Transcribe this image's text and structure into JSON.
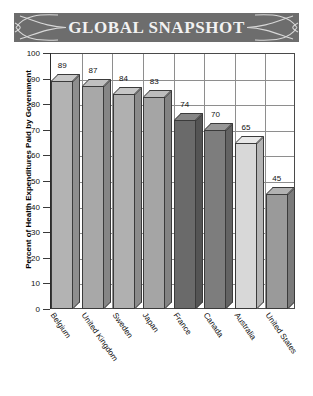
{
  "banner": {
    "title": "GLOBAL SNAPSHOT",
    "background_color": "#6d6d6d",
    "text_color": "#f2f2f2",
    "ornament_left": "swirl-ribbon-ornament",
    "ornament_right": "swirl-ribbon-ornament"
  },
  "chart_data": {
    "type": "bar",
    "title": "GLOBAL SNAPSHOT",
    "xlabel": "",
    "ylabel": "Percent of Health Expenditures Paid by Government",
    "ylim": [
      0,
      100
    ],
    "yticks": [
      0,
      10,
      20,
      30,
      40,
      50,
      60,
      70,
      80,
      90,
      100
    ],
    "grid": true,
    "legend": "none",
    "style_3d": true,
    "categories": [
      "Belgium",
      "United Kingdom",
      "Sweden",
      "Japan",
      "France",
      "Canada",
      "Australia",
      "United States"
    ],
    "values": [
      89,
      87,
      84,
      83,
      74,
      70,
      65,
      45
    ],
    "bar_colors": [
      "#b3b3b3",
      "#a8a8a8",
      "#b0b0b0",
      "#a5a5a5",
      "#6a6a6a",
      "#7d7d7d",
      "#d8d8d8",
      "#9a9a9a"
    ],
    "bar_top_colors": [
      "#c9c9c9",
      "#c0c0c0",
      "#c6c6c6",
      "#bcbcbc",
      "#868686",
      "#979797",
      "#e8e8e8",
      "#b2b2b2"
    ],
    "bar_side_colors": [
      "#8e8e8e",
      "#868686",
      "#8b8b8b",
      "#838383",
      "#545454",
      "#636363",
      "#b4b4b4",
      "#7a7a7a"
    ],
    "data_labels": [
      "89",
      "87",
      "84",
      "83",
      "74",
      "70",
      "65",
      "45"
    ]
  },
  "axis": {
    "tick_labels": [
      "100",
      "90",
      "80",
      "70",
      "60",
      "50",
      "40",
      "30",
      "20",
      "10",
      "0"
    ]
  }
}
